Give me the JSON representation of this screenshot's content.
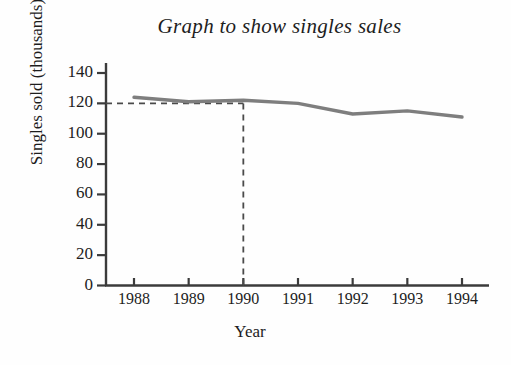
{
  "chart_data": {
    "type": "line",
    "title": "Graph to show singles sales",
    "xlabel": "Year",
    "ylabel": "Singles sold (thousands)",
    "categories": [
      "1988",
      "1989",
      "1990",
      "1991",
      "1992",
      "1993",
      "1994"
    ],
    "x": [
      1988,
      1989,
      1990,
      1991,
      1992,
      1993,
      1994
    ],
    "values": [
      124,
      121,
      122,
      120,
      113,
      115,
      111
    ],
    "series": [
      {
        "name": "Singles sold",
        "values": [
          124,
          121,
          122,
          120,
          113,
          115,
          111
        ]
      }
    ],
    "ylim": [
      0,
      145
    ],
    "xlim": [
      1987.6,
      1994.6
    ],
    "yticks": [
      0,
      20,
      40,
      60,
      80,
      100,
      120,
      140
    ],
    "ytick_labels": [
      "0",
      "20",
      "40",
      "60",
      "80",
      "100",
      "120",
      "140"
    ],
    "xticks": [
      1988,
      1989,
      1990,
      1991,
      1992,
      1993,
      1994
    ],
    "xtick_labels": [
      "1988",
      "1989",
      "1990",
      "1991",
      "1992",
      "1993",
      "1994"
    ],
    "grid": false,
    "legend": null,
    "line_color": "#7e7e7e",
    "axis_color": "#3b3b3b",
    "annotations": [
      {
        "name": "guide-line-horizontal",
        "style": "dashed",
        "y": 120,
        "x_from": 1987.6,
        "x_to": 1990,
        "color": "#4a4a4a"
      },
      {
        "name": "guide-line-vertical",
        "style": "dashed",
        "x": 1990,
        "y_from": 0,
        "y_to": 120,
        "color": "#4a4a4a"
      }
    ]
  }
}
